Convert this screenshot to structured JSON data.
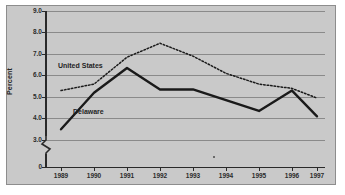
{
  "figure": {
    "cropped_caption_sliver": "",
    "ylabel": "Percent"
  },
  "axes": {
    "y_ticks": [
      "9.0",
      "8.0",
      "7.0",
      "6.0",
      "5.0",
      "4.0",
      "3.0",
      "0"
    ],
    "x_ticks": [
      "1989",
      "1990",
      "1991",
      "1992",
      "1993",
      "1994",
      "1995",
      "1996",
      "1997"
    ],
    "has_axis_break": true,
    "grid": true
  },
  "series_labels": {
    "united_states": "United States",
    "delaware": "Delaware"
  },
  "colors": {
    "plot_background": "#c9c9c9",
    "page_background": "#ffffff",
    "gridline": "#8a8a8a",
    "axis": "#2a2a2a",
    "delaware_line": "#1a1a1a",
    "united_states_line": "#1a1a1a",
    "frame_border": "#8d8d8d"
  },
  "chart_data": {
    "type": "line",
    "title": "",
    "xlabel": "",
    "ylabel": "Percent",
    "x": [
      "1989",
      "1990",
      "1991",
      "1992",
      "1993",
      "1994",
      "1995",
      "1996",
      "1997"
    ],
    "ylim": [
      3.0,
      9.0
    ],
    "ytick_values": [
      3.0,
      4.0,
      5.0,
      6.0,
      7.0,
      8.0,
      9.0
    ],
    "axis_break_below": 3.0,
    "grid": true,
    "legend": "inline-labels",
    "series": [
      {
        "name": "United States",
        "style": "dotted",
        "values": [
          5.3,
          5.6,
          6.85,
          7.5,
          6.9,
          6.1,
          5.6,
          5.4,
          4.95
        ]
      },
      {
        "name": "Delaware",
        "style": "solid",
        "values": [
          3.5,
          5.2,
          6.35,
          5.35,
          5.35,
          4.85,
          4.35,
          5.3,
          4.1
        ]
      }
    ]
  }
}
